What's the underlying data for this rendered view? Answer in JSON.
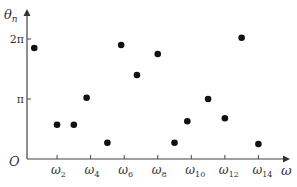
{
  "chart_data": {
    "type": "scatter",
    "title": "",
    "xlabel": "ω",
    "ylabel": "θ_n",
    "origin_label": "O",
    "x_ticks": [
      {
        "label": "ω",
        "sub": "2",
        "value": 2
      },
      {
        "label": "ω",
        "sub": "4",
        "value": 4
      },
      {
        "label": "ω",
        "sub": "6",
        "value": 6
      },
      {
        "label": "ω",
        "sub": "8",
        "value": 8
      },
      {
        "label": "ω",
        "sub": "10",
        "value": 10
      },
      {
        "label": "ω",
        "sub": "12",
        "value": 12
      },
      {
        "label": "ω",
        "sub": "14",
        "value": 14
      }
    ],
    "y_ticks": [
      {
        "label": "π",
        "value_pi": 1
      },
      {
        "label": "2π",
        "value_pi": 2
      }
    ],
    "xlim": [
      0,
      15
    ],
    "ylim_pi": [
      0,
      2.3
    ],
    "grid": false,
    "legend": null,
    "points": [
      {
        "n": 1,
        "theta_pi": 1.85
      },
      {
        "n": 2,
        "theta_pi": 0.57
      },
      {
        "n": 3,
        "theta_pi": 0.57
      },
      {
        "n": 4,
        "theta_pi": 1.02
      },
      {
        "n": 5,
        "theta_pi": 0.27
      },
      {
        "n": 6,
        "theta_pi": 1.9
      },
      {
        "n": 7,
        "theta_pi": 1.4
      },
      {
        "n": 8,
        "theta_pi": 1.75
      },
      {
        "n": 9,
        "theta_pi": 0.27
      },
      {
        "n": 10,
        "theta_pi": 0.63
      },
      {
        "n": 11,
        "theta_pi": 1.0
      },
      {
        "n": 12,
        "theta_pi": 0.68
      },
      {
        "n": 13,
        "theta_pi": 2.02
      },
      {
        "n": 14,
        "theta_pi": 0.25
      }
    ],
    "marker_color": "#111111",
    "axis_color": "#444444"
  }
}
